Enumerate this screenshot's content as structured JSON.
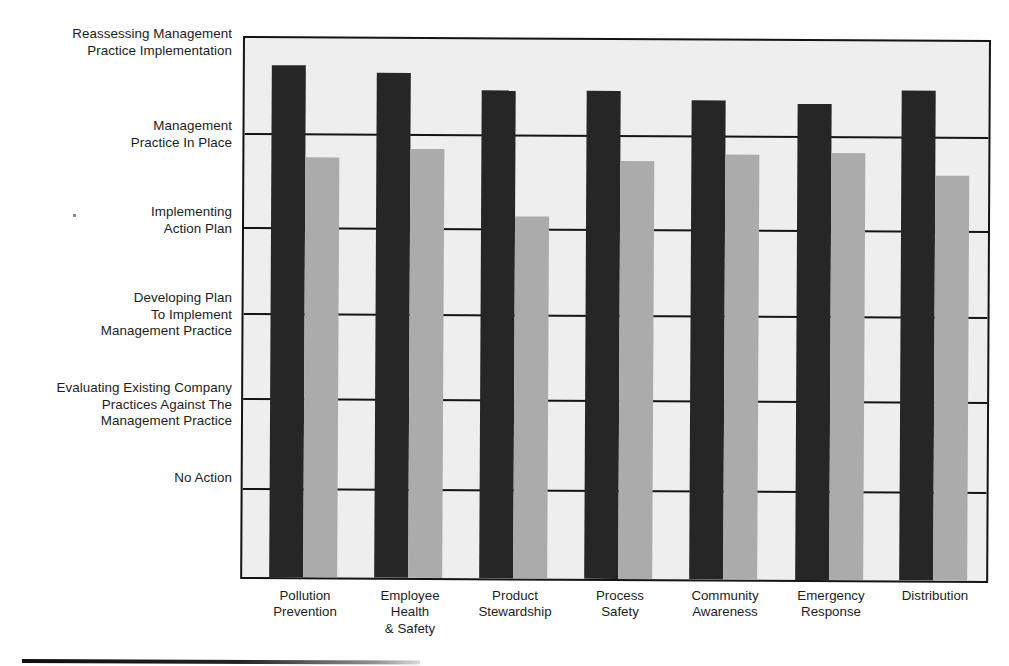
{
  "chart_data": {
    "type": "bar",
    "title": "",
    "subtitle": "",
    "xlabel": "",
    "ylabel": "",
    "grid": true,
    "legend_position": "none",
    "orientation": "vertical",
    "categories": [
      "Pollution\nPrevention",
      "Employee\nHealth\n& Safety",
      "Product\nStewardship",
      "Process\nSafety",
      "Community\nAwareness",
      "Emergency\nResponse",
      "Distribution"
    ],
    "y_tick_labels": [
      "No Action",
      "Evaluating Existing Company\nPractices Against The\nManagement Practice",
      "Developing Plan\nTo Implement\nManagement Practice",
      "Implementing\nAction Plan",
      "Management\nPractice In Place",
      "Reassessing Management\nPractice Implementation"
    ],
    "y_tick_values": [
      0,
      1,
      2,
      3,
      4,
      5
    ],
    "ylim": [
      0,
      5.55
    ],
    "series": [
      {
        "name": "series-dark",
        "color": "#262626",
        "values": [
          5.27,
          5.2,
          5.02,
          5.03,
          4.93,
          4.9,
          5.05
        ]
      },
      {
        "name": "series-light",
        "color": "#ababab",
        "values": [
          4.32,
          4.42,
          3.73,
          4.3,
          4.38,
          4.4,
          4.17
        ]
      }
    ]
  },
  "axis": {
    "y_labels": [
      {
        "text": "Reassessing Management\nPractice Implementation",
        "top": 26
      },
      {
        "text": "Management\nPractice In Place",
        "top": 118
      },
      {
        "text": "Implementing\nAction Plan",
        "top": 204
      },
      {
        "text": "Developing Plan\nTo Implement\nManagement Practice",
        "top": 290
      },
      {
        "text": "Evaluating Existing Company\nPractices Against The\nManagement Practice",
        "top": 380
      },
      {
        "text": "No Action",
        "top": 470
      }
    ],
    "x_labels": [
      {
        "text": "Pollution\nPrevention",
        "center": 62
      },
      {
        "text": "Employee\nHealth\n& Safety",
        "center": 167
      },
      {
        "text": "Product\nStewardship",
        "center": 272
      },
      {
        "text": "Process\nSafety",
        "center": 377
      },
      {
        "text": "Community\nAwareness",
        "center": 482
      },
      {
        "text": "Emergency\nResponse",
        "center": 588
      },
      {
        "text": "Distribution",
        "center": 692
      }
    ],
    "gridline_tops": [
      95,
      189,
      275,
      360,
      450
    ]
  },
  "colors": {
    "bar_dark": "#262626",
    "bar_light": "#ababab",
    "plot_background": "#eeeeee",
    "frame": "#141414",
    "text": "#1d1d1d"
  }
}
